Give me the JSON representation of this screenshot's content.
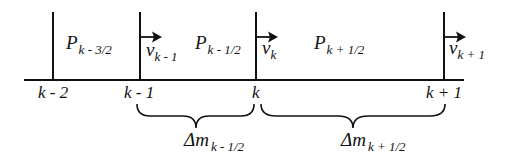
{
  "diagram": {
    "type": "staggered-grid-1d",
    "nodes": [
      {
        "id": "k-2",
        "label": "k - 2",
        "x": 53,
        "has_velocity": false
      },
      {
        "id": "k-1",
        "label": "k - 1",
        "x": 140,
        "has_velocity": true,
        "velocity": {
          "base": "v",
          "sub": "k - 1"
        }
      },
      {
        "id": "k",
        "label": "k",
        "x": 256,
        "has_velocity": true,
        "velocity": {
          "base": "v",
          "sub": "k"
        }
      },
      {
        "id": "k+1",
        "label": "k + 1",
        "x": 444,
        "has_velocity": true,
        "velocity": {
          "base": "v",
          "sub": "k + 1"
        }
      }
    ],
    "cells": [
      {
        "pressure": {
          "base": "P",
          "sub": "k - 3/2"
        }
      },
      {
        "pressure": {
          "base": "P",
          "sub": "k - 1/2"
        }
      },
      {
        "pressure": {
          "base": "P",
          "sub": "k + 1/2"
        }
      }
    ],
    "mass_intervals": [
      {
        "from": "k - 1",
        "to": "k",
        "label": {
          "base": "Δm",
          "sub": "k - 1/2"
        }
      },
      {
        "from": "k",
        "to": "k + 1",
        "label": {
          "base": "Δm",
          "sub": "k + 1/2"
        }
      }
    ],
    "colors": {
      "line": "#111111",
      "background": "#ffffff"
    }
  }
}
